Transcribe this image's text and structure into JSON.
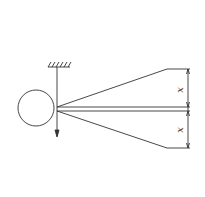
{
  "diagram": {
    "type": "mechanics-schematic",
    "labels": {
      "upper_dimension": "x",
      "lower_dimension": "x"
    },
    "elements": [
      "circle-mass",
      "fixed-support-hatch",
      "vertical-string",
      "downward-arrow",
      "upper-diverging-line",
      "lower-diverging-line",
      "central-horizontal-rod",
      "dimension-line-right"
    ],
    "colors": {
      "stroke": "#333333",
      "background": "#ffffff"
    }
  }
}
